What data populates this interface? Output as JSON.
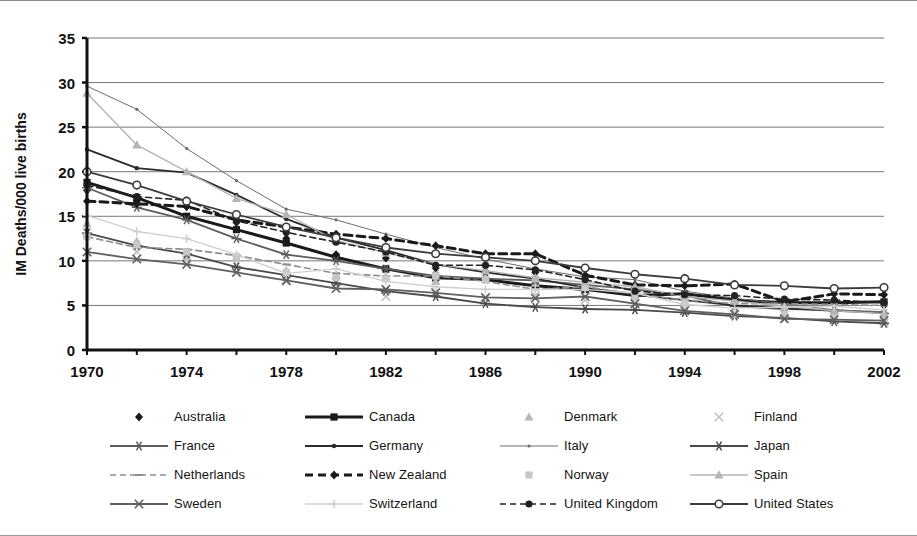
{
  "chart_data": {
    "type": "line",
    "title": "",
    "xlabel": "",
    "ylabel": "IM Deaths/000 live births",
    "xlim": [
      1970,
      2002
    ],
    "ylim": [
      0,
      35
    ],
    "yticks": [
      0,
      5,
      10,
      15,
      20,
      25,
      30,
      35
    ],
    "xticks": [
      1970,
      1974,
      1978,
      1982,
      1986,
      1990,
      1994,
      1998,
      2002
    ],
    "x": [
      1970,
      1972,
      1974,
      1976,
      1978,
      1980,
      1982,
      1984,
      1986,
      1988,
      1990,
      1992,
      1994,
      1996,
      1998,
      2000,
      2002
    ],
    "grid": "horizontal",
    "legend_position": "bottom",
    "legend_columns": 4,
    "series": [
      {
        "name": "Australia",
        "marker": "diamond",
        "line": "none",
        "color": "#1a1a1a",
        "values": [
          17.9,
          16.7,
          16.1,
          14.3,
          12.5,
          10.7,
          10.3,
          9.2,
          8.8,
          8.7,
          8.2,
          7.0,
          5.9,
          5.8,
          5.0,
          5.2,
          5.0
        ]
      },
      {
        "name": "Canada",
        "marker": "square",
        "line": "solid-thick",
        "color": "#1a1a1a",
        "values": [
          18.8,
          17.1,
          15.0,
          13.5,
          12.0,
          10.4,
          9.1,
          8.1,
          7.9,
          7.2,
          6.8,
          6.1,
          6.3,
          5.6,
          5.3,
          5.3,
          5.4
        ]
      },
      {
        "name": "Denmark",
        "marker": "triangle",
        "line": "none",
        "color": "#b9b9b9",
        "values": [
          14.2,
          12.2,
          10.5,
          10.4,
          8.9,
          8.4,
          8.2,
          7.7,
          8.3,
          7.5,
          7.5,
          6.6,
          5.5,
          5.6,
          4.7,
          5.3,
          4.4
        ]
      },
      {
        "name": "Finland",
        "marker": "cross",
        "line": "none",
        "color": "#c0c0c0",
        "values": [
          13.2,
          11.0,
          10.1,
          9.6,
          7.7,
          7.6,
          6.0,
          6.5,
          5.8,
          6.1,
          5.6,
          5.2,
          4.7,
          4.0,
          4.2,
          3.8,
          3.0
        ]
      },
      {
        "name": "France",
        "marker": "star",
        "line": "solid",
        "color": "#5d5d5d",
        "values": [
          18.2,
          16.0,
          14.6,
          12.5,
          10.7,
          10.0,
          9.1,
          8.3,
          8.0,
          7.8,
          7.3,
          6.8,
          6.1,
          4.9,
          4.6,
          4.5,
          4.1
        ]
      },
      {
        "name": "Germany",
        "marker": "dot",
        "line": "solid",
        "color": "#2b2b2b",
        "values": [
          22.5,
          20.4,
          19.9,
          17.4,
          14.7,
          12.6,
          11.2,
          9.6,
          8.7,
          8.0,
          7.0,
          6.2,
          5.6,
          5.0,
          4.7,
          4.4,
          4.2
        ]
      },
      {
        "name": "Italy",
        "marker": "dot-small",
        "line": "thin",
        "color": "#6c6c6c",
        "values": [
          29.6,
          27.0,
          22.6,
          19.0,
          15.8,
          14.6,
          13.0,
          11.5,
          10.2,
          9.1,
          8.2,
          7.9,
          6.6,
          5.8,
          5.2,
          4.5,
          4.3
        ]
      },
      {
        "name": "Japan",
        "marker": "asterisk",
        "line": "solid",
        "color": "#4a4a4a",
        "values": [
          13.1,
          11.7,
          10.8,
          9.3,
          8.4,
          7.5,
          6.6,
          6.0,
          5.2,
          4.8,
          4.6,
          4.5,
          4.2,
          3.8,
          3.6,
          3.2,
          3.0
        ]
      },
      {
        "name": "Netherlands",
        "marker": "dash",
        "line": "dashed",
        "color": "#8e8e8e",
        "values": [
          12.7,
          11.5,
          11.3,
          10.6,
          9.6,
          8.6,
          8.3,
          8.3,
          7.7,
          6.8,
          7.1,
          6.3,
          5.6,
          5.2,
          5.2,
          5.1,
          5.0
        ]
      },
      {
        "name": "New Zealand",
        "marker": "diamond",
        "line": "dashed-thick",
        "color": "#1a1a1a",
        "values": [
          16.7,
          16.4,
          16.1,
          14.6,
          13.8,
          13.0,
          12.5,
          11.7,
          10.8,
          10.8,
          8.4,
          7.3,
          7.2,
          7.4,
          5.4,
          6.3,
          6.2
        ]
      },
      {
        "name": "Norway",
        "marker": "square",
        "line": "none",
        "color": "#c7c7c7",
        "values": [
          12.7,
          11.8,
          11.0,
          10.5,
          8.7,
          8.1,
          8.0,
          8.3,
          7.9,
          8.0,
          7.0,
          5.9,
          5.2,
          4.0,
          4.0,
          3.8,
          3.5
        ]
      },
      {
        "name": "Spain",
        "marker": "triangle",
        "line": "thin-light",
        "color": "#b4b4b4",
        "values": [
          28.8,
          23.0,
          20.0,
          17.0,
          15.2,
          12.3,
          10.9,
          9.6,
          8.9,
          8.1,
          7.6,
          7.1,
          6.0,
          5.5,
          4.9,
          4.4,
          4.1
        ]
      },
      {
        "name": "Sweden",
        "marker": "cross",
        "line": "solid",
        "color": "#606060",
        "values": [
          11.0,
          10.2,
          9.6,
          8.7,
          7.8,
          6.9,
          6.8,
          6.4,
          5.9,
          5.8,
          6.0,
          5.2,
          4.4,
          4.0,
          3.5,
          3.4,
          3.3
        ]
      },
      {
        "name": "Switzerland",
        "marker": "plus",
        "line": "thin-light",
        "color": "#cfcfcf",
        "values": [
          15.1,
          13.3,
          12.5,
          10.7,
          8.6,
          9.1,
          7.7,
          7.1,
          6.8,
          6.8,
          6.8,
          6.4,
          5.1,
          4.7,
          4.8,
          4.9,
          4.5
        ]
      },
      {
        "name": "United Kingdom",
        "marker": "circle-filled",
        "line": "dashed",
        "color": "#222222",
        "values": [
          18.5,
          17.2,
          16.8,
          14.5,
          13.2,
          12.1,
          11.0,
          9.5,
          9.5,
          9.0,
          7.9,
          6.6,
          6.2,
          6.1,
          5.7,
          5.6,
          5.3
        ]
      },
      {
        "name": "United States",
        "marker": "circle-open",
        "line": "solid",
        "color": "#3c3c3c",
        "values": [
          20.0,
          18.5,
          16.7,
          15.2,
          13.8,
          12.6,
          11.5,
          10.8,
          10.4,
          10.0,
          9.2,
          8.5,
          8.0,
          7.3,
          7.2,
          6.9,
          7.0
        ]
      }
    ]
  },
  "legend": {
    "rows": [
      [
        "Australia",
        "Canada",
        "Denmark",
        "Finland"
      ],
      [
        "France",
        "Germany",
        "Italy",
        "Japan"
      ],
      [
        "Netherlands",
        "New Zealand",
        "Norway",
        "Spain"
      ],
      [
        "Sweden",
        "Switzerland",
        "United Kingdom",
        "United States"
      ]
    ]
  }
}
